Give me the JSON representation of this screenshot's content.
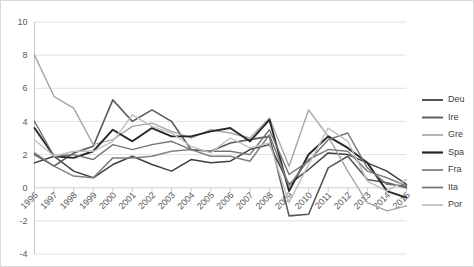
{
  "chart_data": {
    "type": "line",
    "title": "",
    "subtitle": "",
    "xlabel": "",
    "ylabel": "",
    "xlim": [
      1996,
      2015
    ],
    "ylim": [
      -4,
      10
    ],
    "ytick_step": 2,
    "yticks": [
      -4,
      -2,
      0,
      2,
      4,
      6,
      8,
      10
    ],
    "ytick_labels": [
      "-4",
      "-2",
      "0",
      "2",
      "4",
      "6",
      "8",
      "10"
    ],
    "grid": true,
    "grid_axis": "y",
    "legend_position": "right",
    "categories": [
      1996,
      1997,
      1998,
      1999,
      2000,
      2001,
      2002,
      2003,
      2004,
      2005,
      2006,
      2007,
      2008,
      2009,
      2010,
      2011,
      2012,
      2013,
      2014,
      2015
    ],
    "xtick_labels": [
      "1996",
      "1997",
      "1998",
      "1999",
      "2000",
      "2001",
      "2002",
      "2003",
      "2004",
      "2005",
      "2006",
      "2007",
      "2008",
      "2009",
      "2010",
      "2011",
      "2012",
      "2013",
      "2014",
      "2015"
    ],
    "series": [
      {
        "name": "Deu",
        "color": "#404040",
        "width": 1.5,
        "values": [
          1.5,
          1.9,
          1.0,
          0.6,
          1.4,
          1.9,
          1.4,
          1.0,
          1.7,
          1.5,
          1.6,
          2.3,
          2.6,
          0.2,
          1.1,
          2.1,
          2.0,
          1.5,
          1.0,
          0.2
        ]
      },
      {
        "name": "Ire",
        "color": "#595959",
        "width": 1.6,
        "values": [
          2.0,
          1.3,
          2.1,
          2.5,
          5.3,
          4.0,
          4.7,
          4.0,
          2.3,
          2.2,
          2.7,
          2.9,
          3.1,
          -1.7,
          -1.6,
          1.2,
          1.9,
          0.5,
          0.3,
          0.0
        ]
      },
      {
        "name": "Gre",
        "color": "#a6a6a6",
        "width": 1.4,
        "values": [
          8.0,
          5.5,
          4.8,
          2.6,
          2.9,
          3.7,
          3.9,
          3.4,
          3.0,
          3.5,
          3.3,
          3.0,
          4.2,
          1.3,
          4.7,
          3.1,
          1.0,
          -0.9,
          -1.4,
          -1.1
        ]
      },
      {
        "name": "Spa",
        "color": "#262626",
        "width": 1.9,
        "values": [
          3.6,
          1.9,
          1.8,
          2.2,
          3.5,
          2.8,
          3.6,
          3.1,
          3.1,
          3.4,
          3.6,
          2.8,
          4.1,
          -0.2,
          2.0,
          3.1,
          2.4,
          1.5,
          -0.2,
          -0.6
        ]
      },
      {
        "name": "Fra",
        "color": "#808080",
        "width": 1.5,
        "values": [
          2.1,
          1.3,
          0.7,
          0.6,
          1.8,
          1.8,
          1.9,
          2.2,
          2.3,
          1.9,
          1.9,
          1.6,
          3.2,
          0.1,
          1.7,
          2.3,
          2.2,
          1.0,
          0.6,
          0.1
        ]
      },
      {
        "name": "Ita",
        "color": "#737373",
        "width": 1.4,
        "values": [
          4.0,
          1.9,
          2.0,
          1.7,
          2.6,
          2.3,
          2.6,
          2.8,
          2.3,
          2.2,
          2.2,
          2.0,
          3.5,
          0.8,
          1.6,
          2.9,
          3.3,
          1.2,
          0.2,
          0.1
        ]
      },
      {
        "name": "Por",
        "color": "#bfbfbf",
        "width": 1.4,
        "values": [
          2.9,
          1.9,
          2.2,
          2.2,
          2.8,
          4.4,
          3.7,
          3.3,
          2.5,
          2.1,
          3.0,
          2.4,
          2.7,
          -0.9,
          1.4,
          3.6,
          2.8,
          0.4,
          -0.2,
          0.5
        ]
      }
    ]
  },
  "legend": {
    "items": [
      {
        "label": "Deu"
      },
      {
        "label": "Ire"
      },
      {
        "label": "Gre"
      },
      {
        "label": "Spa"
      },
      {
        "label": "Fra"
      },
      {
        "label": "Ita"
      },
      {
        "label": "Por"
      }
    ]
  }
}
